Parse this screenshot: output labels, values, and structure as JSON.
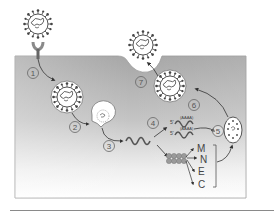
{
  "diagram": {
    "colors": {
      "cell_top": "#a9a9a9",
      "cell_bottom": "#ffffff",
      "outline": "#444444",
      "virion_fill": "#ffffff",
      "step_circle": "#666666"
    },
    "steps": [
      {
        "id": 1,
        "label": "1",
        "meaning": "attachment and entry"
      },
      {
        "id": 2,
        "label": "2",
        "meaning": "uncoating"
      },
      {
        "id": 3,
        "label": "3",
        "meaning": "genome release"
      },
      {
        "id": 4,
        "label": "4",
        "meaning": "replication"
      },
      {
        "id": 5,
        "label": "5",
        "meaning": "assembly"
      },
      {
        "id": 6,
        "label": "6",
        "meaning": "maturation in vesicle"
      },
      {
        "id": 7,
        "label": "7",
        "meaning": "release by exocytosis"
      }
    ],
    "proteins": [
      {
        "label": "M"
      },
      {
        "label": "N"
      },
      {
        "label": "E"
      },
      {
        "label": "C"
      }
    ],
    "rna_tag": "(AAAA)"
  }
}
